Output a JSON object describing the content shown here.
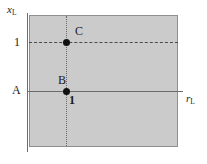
{
  "figure": {
    "width": 207,
    "height": 164,
    "background_color": "#ffffff",
    "region_fill_color": "#cbcbcb",
    "line_color": "#6b6b6b",
    "point_color": "#101010"
  },
  "axes": {
    "y_axis_label": "x",
    "y_axis_subscript": "L",
    "x_axis_label": "r",
    "x_axis_subscript": "L"
  },
  "ticks": {
    "y_tick_one": "1",
    "x_tick_one": "1"
  },
  "points": [
    {
      "id": "C",
      "label": "C",
      "x": 1,
      "y": 1
    },
    {
      "id": "B",
      "label": "B",
      "x": 1,
      "y": 0
    }
  ],
  "lines": {
    "horizontal_solid_label": "A",
    "horizontal_dashed_level": "1",
    "vertical_dotted_position": "1"
  },
  "chart_data": {
    "type": "scatter",
    "title": "",
    "xlabel": "r_L",
    "ylabel": "x_L",
    "xlim": [
      0,
      2.45
    ],
    "ylim": [
      -1.15,
      1.35
    ],
    "grid": false,
    "legend": null,
    "xticks": [
      1
    ],
    "xticklabels": [
      "1"
    ],
    "yticks": [
      1
    ],
    "yticklabels": [
      "1"
    ],
    "series": [
      {
        "name": "points",
        "x": [
          1,
          1
        ],
        "y": [
          1,
          0
        ],
        "labels": [
          "C",
          "B"
        ]
      }
    ],
    "annotations": [
      {
        "text": "A",
        "x": 0,
        "y": 0,
        "note": "label at left end of solid horizontal line"
      },
      {
        "text": "C",
        "x": 1,
        "y": 1,
        "note": "label above-right of point C"
      },
      {
        "text": "B",
        "x": 1,
        "y": 0,
        "note": "label above-left of point B"
      },
      {
        "text": "1",
        "x": 1,
        "y": 0,
        "note": "bold x tick label below-right of point B"
      },
      {
        "text": "1",
        "x": 0,
        "y": 1,
        "note": "y tick label left of dashed line"
      }
    ],
    "reference_lines": [
      {
        "orientation": "horizontal",
        "value": 1,
        "style": "dashed"
      },
      {
        "orientation": "horizontal",
        "value": 0,
        "style": "solid"
      },
      {
        "orientation": "vertical",
        "value": 1,
        "style": "dotted"
      }
    ],
    "shaded_region": {
      "x_range": [
        0,
        2.45
      ],
      "y_range": [
        -1.15,
        1.35
      ],
      "color": "#cbcbcb"
    }
  }
}
